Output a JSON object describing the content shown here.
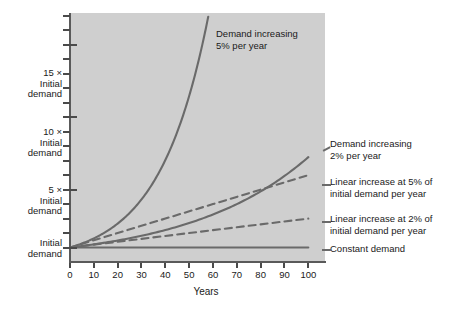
{
  "chart_data": {
    "type": "line",
    "title": "",
    "xlabel": "Years",
    "ylabel": "",
    "xlim": [
      0,
      107
    ],
    "ylim": [
      0,
      17.2
    ],
    "grid": false,
    "legend_position": "inline-annotations",
    "x_ticks": [
      0,
      10,
      20,
      30,
      40,
      50,
      60,
      70,
      80,
      90,
      100
    ],
    "x_tick_labels": [
      "0",
      "10",
      "20",
      "30",
      "40",
      "50",
      "60",
      "70",
      "80",
      "90",
      "100"
    ],
    "y_ticks_major": [
      1,
      5,
      10,
      15
    ],
    "y_tick_major_labels": [
      "Initial demand",
      "5 × Initial demand",
      "10 × Initial demand",
      "15 × Initial demand"
    ],
    "y_ticks_minor": [
      2,
      3,
      4,
      6,
      7,
      8,
      9,
      11,
      12,
      13,
      14,
      16,
      17
    ],
    "series": [
      {
        "name": "Demand increasing 5% per year",
        "style": "solid",
        "formula": "1.05^t",
        "x": [
          0,
          5,
          10,
          15,
          20,
          25,
          30,
          35,
          40,
          45,
          50,
          55,
          58
        ],
        "values": [
          1.0,
          1.28,
          1.63,
          2.08,
          2.65,
          3.39,
          4.32,
          5.52,
          7.04,
          8.99,
          11.47,
          14.64,
          16.95
        ]
      },
      {
        "name": "Demand increasing 2% per year",
        "style": "solid",
        "formula": "1.02^t",
        "x": [
          0,
          10,
          20,
          30,
          40,
          50,
          60,
          70,
          80,
          90,
          100
        ],
        "values": [
          1.0,
          1.22,
          1.49,
          1.81,
          2.21,
          2.69,
          3.28,
          4.0,
          4.88,
          5.94,
          7.24
        ]
      },
      {
        "name": "Linear increase at 5% of initial demand per year",
        "style": "dashed",
        "formula": "1 + 0.05t",
        "x": [
          0,
          20,
          40,
          60,
          80,
          100
        ],
        "values": [
          1.0,
          2.0,
          3.0,
          4.0,
          5.0,
          6.0
        ]
      },
      {
        "name": "Linear increase at 2% of initial demand per year",
        "style": "dashed",
        "formula": "1 + 0.02t",
        "x": [
          0,
          20,
          40,
          60,
          80,
          100
        ],
        "values": [
          1.0,
          1.4,
          1.8,
          2.2,
          2.6,
          3.0
        ]
      },
      {
        "name": "Constant demand",
        "style": "solid",
        "formula": "1",
        "x": [
          0,
          100
        ],
        "values": [
          1.0,
          1.0
        ]
      }
    ],
    "annotations": [
      {
        "key": "exp5",
        "line1": "Demand increasing",
        "line2": "5% per year"
      },
      {
        "key": "exp2",
        "line1": "Demand increasing",
        "line2": "2% per year"
      },
      {
        "key": "lin5",
        "line1": "Linear increase at 5% of",
        "line2": "initial demand per year"
      },
      {
        "key": "lin2",
        "line1": "Linear increase at 2% of",
        "line2": "initial demand per year"
      },
      {
        "key": "const",
        "line1": "Constant demand",
        "line2": ""
      }
    ]
  },
  "axes": {
    "x_title": "Years",
    "x_tick_labels": [
      "0",
      "10",
      "20",
      "30",
      "40",
      "50",
      "60",
      "70",
      "80",
      "90",
      "100"
    ],
    "y_labels": [
      {
        "top": "15 ×",
        "mid": "Initial",
        "bot": "demand"
      },
      {
        "top": "10 ×",
        "mid": "Initial",
        "bot": "demand"
      },
      {
        "top": "5 ×",
        "mid": "Initial",
        "bot": "demand"
      },
      {
        "top": "",
        "mid": "Initial",
        "bot": "demand"
      }
    ]
  },
  "colors": {
    "plot_background": "#cfcfcf",
    "page_background": "#ffffff",
    "curve": "#6a6a6a",
    "axis": "#5a5a5a",
    "text": "#1a1a1a"
  }
}
